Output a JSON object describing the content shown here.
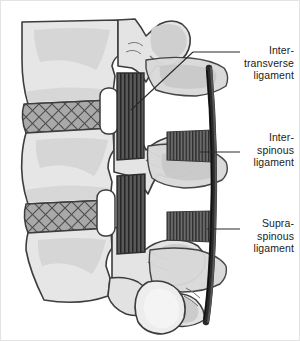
{
  "figure": {
    "border_color": "#e3e3e3",
    "background": "#ffffff"
  },
  "labels": [
    {
      "id": "intertransverse",
      "text": "Inter-\ntransverse\nligament",
      "lines": [
        "Inter-",
        "transverse",
        "ligament"
      ],
      "leader": "diagonal"
    },
    {
      "id": "interspinous",
      "text": "Inter-\nspinous\nligament",
      "lines": [
        "Inter-",
        "spinous",
        "ligament"
      ],
      "leader": "horizontal"
    },
    {
      "id": "supraspinous",
      "text": "Supra-\nspinous\nligament",
      "lines": [
        "Supra-",
        "spinous",
        "ligament"
      ],
      "leader": "horizontal"
    }
  ],
  "colors": {
    "bone_fill": "#e8e8e8",
    "bone_shade": "#cccccc",
    "bone_shade_dark": "#bdbdbd",
    "outline": "#3c3c3c",
    "disc_fill": "#a8a8a8",
    "disc_hatch": "#4a4a4a",
    "ligament_dark": "#4e4e4e",
    "ligament_stripe": "#2a2a2a",
    "canal_white": "#ffffff",
    "leader_line": "#2b2b2b",
    "text": "#1b1b1b"
  }
}
